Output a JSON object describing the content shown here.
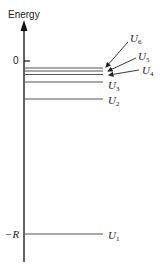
{
  "diagram": {
    "y_axis_label": "Energy",
    "tick_zero_label": "0",
    "tick_minus_r_label": "−R",
    "levels": [
      {
        "name": "U",
        "sub": "6",
        "y": 68
      },
      {
        "name": "U",
        "sub": "5",
        "y": 71
      },
      {
        "name": "U",
        "sub": "4",
        "y": 74
      },
      {
        "name": "U",
        "sub": "3",
        "y": 82
      },
      {
        "name": "U",
        "sub": "2",
        "y": 99
      },
      {
        "name": "U",
        "sub": "1",
        "y": 234
      }
    ],
    "line_color": "#555555",
    "axis_color": "#111111"
  }
}
